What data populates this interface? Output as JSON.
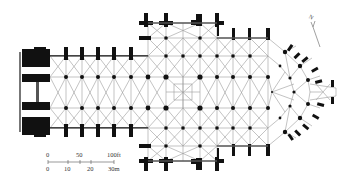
{
  "diagram": {
    "type": "architectural-floor-plan",
    "colors": {
      "walls": "#111111",
      "vault_lines": "#888888",
      "background": "#ffffff"
    }
  },
  "compass": {
    "label": "N",
    "icon": "north-arrow-icon"
  },
  "scale_bar": {
    "feet": {
      "ticks": [
        "0",
        "50",
        "100ft"
      ]
    },
    "meters": {
      "ticks": [
        "0",
        "10",
        "20",
        "30m"
      ]
    }
  },
  "plan": {
    "nave_bays": 6,
    "transept_bays": 4,
    "choir_bays": 3,
    "column_x": [
      66,
      82,
      98,
      114,
      131,
      147,
      166,
      183,
      200,
      217,
      233,
      250,
      268
    ],
    "row_y": [
      23,
      38,
      56,
      77,
      108,
      128,
      146,
      161
    ]
  }
}
